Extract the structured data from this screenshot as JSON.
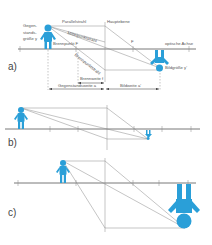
{
  "diagram": {
    "type": "thin lens image construction",
    "accent_color": "#2a9fd8",
    "line_color": "#888888",
    "panels": [
      {
        "id": "a",
        "label": "a)",
        "labels": {
          "object_size": "Gegen-\nstands-\ngröße y",
          "parallel_ray": "Parallelstrahl",
          "principal_plane": "Hauptebene",
          "center_ray": "Mittelpunktstrahl",
          "focal_point": "Brennpunkt F",
          "focal_ray": "Brennpunktstrahl",
          "focal_point_right": "F",
          "optical_axis": "optische Achse",
          "image_size": "Bildgröße y'",
          "focal_length": "Brennweite f",
          "object_distance": "Gegenstandsweite a",
          "image_distance": "Bildweite a'"
        }
      },
      {
        "id": "b",
        "label": "b)"
      },
      {
        "id": "c",
        "label": "c)"
      }
    ]
  }
}
